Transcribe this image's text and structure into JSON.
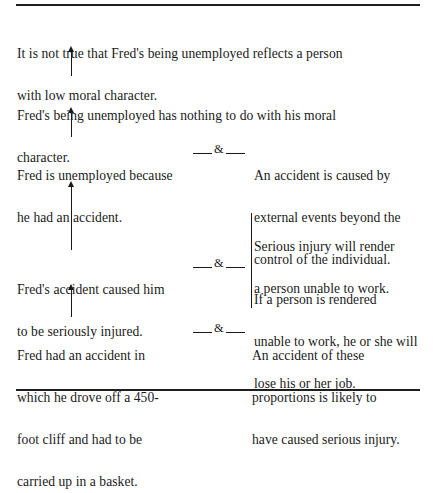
{
  "diagram": {
    "type": "argument-chain",
    "statements": {
      "conclusion": {
        "lines": [
          "It is not true that Fred's being unemployed reflects a person",
          "with low moral character."
        ]
      },
      "claim2": {
        "lines": [
          "Fred's being unemployed has nothing to do with his moral",
          "character."
        ]
      },
      "claim3": {
        "lines": [
          "Fred is unemployed because",
          "he had an accident."
        ]
      },
      "warrant3": {
        "lines": [
          "An accident is caused by",
          "external events beyond the",
          "control of the individual."
        ]
      },
      "claim4": {
        "lines": [
          "Fred's accident caused him",
          "to be seriously injured."
        ]
      },
      "warrant4a": {
        "lines": [
          "Serious injury will render",
          "a person unable to work."
        ]
      },
      "warrant4b": {
        "lines": [
          "If a person is rendered",
          "unable to work, he or she will",
          "lose his or her job."
        ]
      },
      "premise": {
        "lines": [
          "Fred had an accident in",
          "which he drove off a 450-",
          "foot cliff and had to be",
          "carried up in a basket."
        ]
      },
      "warrant5": {
        "lines": [
          "An accident of these",
          "proportions is likely to",
          "have caused serious injury."
        ]
      }
    },
    "connector_symbol": "&",
    "arrows": [
      {
        "from": "claim2",
        "to": "conclusion"
      },
      {
        "from": "claim3",
        "to": "claim2"
      },
      {
        "from": "claim4",
        "to": "claim3"
      },
      {
        "from": "premise",
        "to": "claim4"
      }
    ],
    "joins": [
      {
        "claim": "claim3",
        "with": [
          "warrant3"
        ]
      },
      {
        "claim": "claim4",
        "with": [
          "warrant4a",
          "warrant4b"
        ]
      },
      {
        "claim": "premise",
        "with": [
          "warrant5"
        ]
      }
    ]
  }
}
